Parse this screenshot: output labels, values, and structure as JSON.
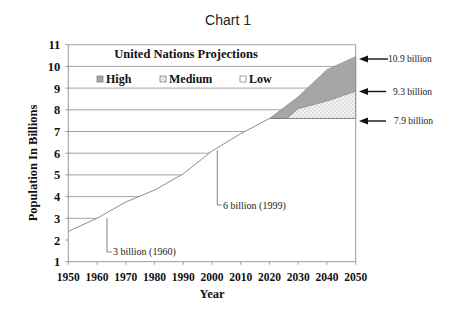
{
  "chart_data": {
    "type": "area",
    "title": "Chart 1",
    "xlabel": "Year",
    "ylabel": "Population In Billions",
    "xlim": [
      1950,
      2050
    ],
    "ylim": [
      1,
      11
    ],
    "x_ticks": [
      1950,
      1960,
      1970,
      1980,
      1990,
      2000,
      2010,
      2020,
      2030,
      2040,
      2050
    ],
    "y_ticks": [
      1,
      2,
      3,
      4,
      5,
      6,
      7,
      8,
      9,
      10,
      11
    ],
    "grid": "horizontal",
    "legend": {
      "title": "United Nations Projections",
      "position": "top-left inside",
      "entries": [
        {
          "label": "High",
          "swatch": "gray"
        },
        {
          "label": "Medium",
          "swatch": "dotted"
        },
        {
          "label": "Low",
          "swatch": "white"
        }
      ]
    },
    "series": [
      {
        "name": "Historical",
        "x": [
          1950,
          1960,
          1970,
          1980,
          1990,
          2000,
          2010,
          2020
        ],
        "values": [
          2.4,
          3.0,
          3.75,
          4.3,
          5.05,
          6.1,
          6.9,
          7.6
        ]
      },
      {
        "name": "High",
        "x": [
          2020,
          2030,
          2040,
          2050
        ],
        "values": [
          7.6,
          8.6,
          9.85,
          10.45
        ]
      },
      {
        "name": "Medium",
        "x": [
          2020,
          2026,
          2030,
          2040,
          2050
        ],
        "values": [
          7.6,
          7.6,
          8.05,
          8.4,
          8.85
        ]
      },
      {
        "name": "Low",
        "x": [
          2020,
          2050
        ],
        "values": [
          7.6,
          7.6
        ]
      }
    ],
    "annotations": [
      {
        "text": "3 billion (1960)",
        "x": 1963,
        "y": 3.0
      },
      {
        "text": "6 billion (1999)",
        "x": 2001,
        "y": 6.1
      },
      {
        "text": "10.9 billion",
        "x": 2050,
        "y": 10.45,
        "arrow": true
      },
      {
        "text": "9.3 billion",
        "x": 2050,
        "y": 8.85,
        "arrow": true
      },
      {
        "text": "7.9 billion",
        "x": 2050,
        "y": 7.6,
        "arrow": true
      }
    ]
  },
  "colors": {
    "high_fill": "#a6a6a6",
    "medium_fill": "#f0f0f0",
    "dot": "#9a9a9a",
    "line": "#808080",
    "grid": "#8c8c8c",
    "text": "#111111"
  }
}
